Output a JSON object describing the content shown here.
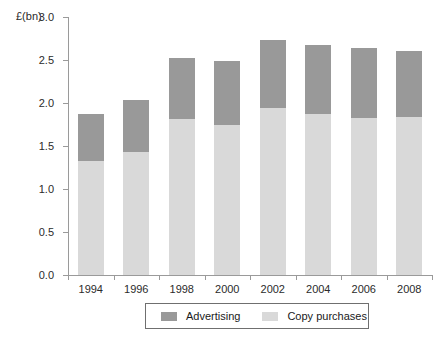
{
  "chart_data": {
    "type": "bar",
    "subtype": "stacked",
    "title": "",
    "xlabel": "",
    "ylabel": "£(bn)",
    "ylim": [
      0.0,
      3.0
    ],
    "ytick_labels": [
      "3.0",
      "2.5",
      "2.0",
      "1.5",
      "1.0",
      "0.5",
      "0.0"
    ],
    "ytick_values": [
      3.0,
      2.5,
      2.0,
      1.5,
      1.0,
      0.5,
      0.0
    ],
    "grid": false,
    "legend_position": "bottom-center",
    "categories": [
      "1994",
      "1996",
      "1998",
      "2000",
      "2002",
      "2004",
      "2006",
      "2008"
    ],
    "series": [
      {
        "name": "Copy purchases",
        "color": "#d9d9d9",
        "values": [
          1.32,
          1.43,
          1.81,
          1.74,
          1.94,
          1.87,
          1.82,
          1.84
        ]
      },
      {
        "name": "Advertising",
        "color": "#999999",
        "values": [
          0.55,
          0.6,
          0.71,
          0.75,
          0.79,
          0.81,
          0.82,
          0.76
        ]
      }
    ],
    "totals": [
      1.87,
      2.03,
      2.52,
      2.49,
      2.73,
      2.68,
      2.64,
      2.6
    ]
  },
  "axis": {
    "unit_label": "£(bn)"
  },
  "legend": {
    "entries": [
      {
        "label": "Advertising",
        "color": "#999999"
      },
      {
        "label": "Copy purchases",
        "color": "#d9d9d9"
      }
    ]
  }
}
